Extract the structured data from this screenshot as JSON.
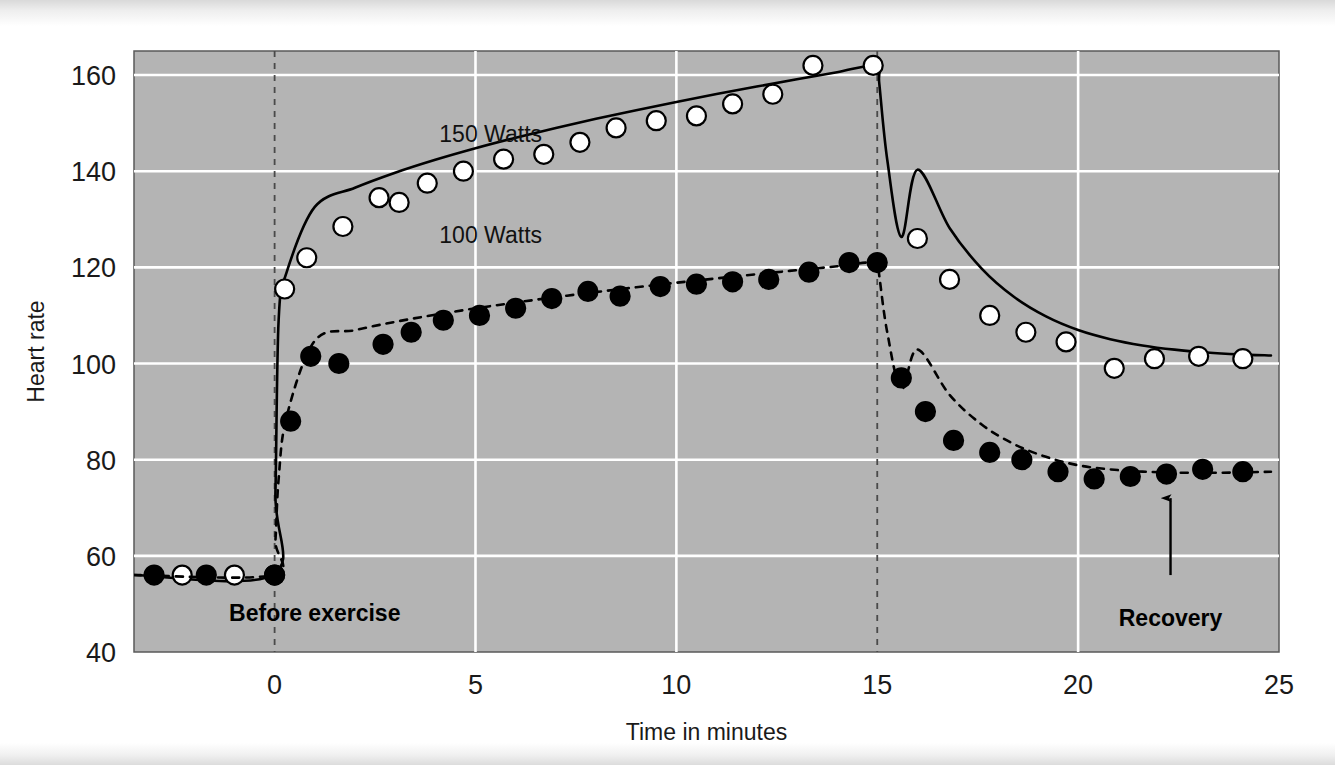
{
  "chart_data": {
    "type": "line",
    "title": "",
    "xlabel": "Time in minutes",
    "ylabel": "Heart rate",
    "xlim": [
      -3.5,
      25
    ],
    "ylim": [
      40,
      165
    ],
    "xticks": [
      0,
      5,
      10,
      15,
      20,
      25
    ],
    "xtick_labels": [
      "0",
      "5",
      "10",
      "15",
      "20",
      "25"
    ],
    "yticks": [
      40,
      60,
      80,
      100,
      120,
      140,
      160
    ],
    "ytick_labels": [
      "40",
      "60",
      "80",
      "100",
      "120",
      "140",
      "160"
    ],
    "grid": "horizontal-white-gridlines-on-gray-panel",
    "legend_position": "inline-labels-on-curves",
    "panel_color": "#b4b4b4",
    "gridline_color": "#ffffff",
    "annotations": [
      {
        "name": "before-exercise",
        "text": "Before exercise",
        "x": 1.0,
        "y": 46.5
      },
      {
        "name": "recovery",
        "text": "Recovery",
        "x": 22.3,
        "y": 45.5
      },
      {
        "name": "exercise-start-marker",
        "text": "",
        "x": 0,
        "y": 0
      },
      {
        "name": "exercise-end-marker",
        "text": "",
        "x": 15,
        "y": 0
      }
    ],
    "vertical_markers": [
      0,
      15
    ],
    "recovery_arrow": {
      "x": 22.3,
      "y_tail": 56,
      "y_head": 72
    },
    "series": [
      {
        "name": "150 Watts",
        "label": "150 Watts",
        "label_x": 4.1,
        "label_y": 146,
        "marker": "open-circle",
        "line_style": "solid",
        "color": "#000000",
        "marker_fill": "#ffffff",
        "x": [
          -2.3,
          -1.0,
          0.0,
          0.25,
          0.8,
          1.7,
          2.6,
          3.1,
          3.8,
          4.7,
          5.7,
          6.7,
          7.6,
          8.5,
          9.5,
          10.5,
          11.4,
          12.4,
          13.4,
          14.9,
          16.0,
          16.8,
          17.8,
          18.7,
          19.7,
          20.9,
          21.9,
          23.0,
          24.1
        ],
        "y": [
          56,
          56,
          56,
          115.5,
          122,
          128.5,
          134.5,
          133.5,
          137.5,
          140,
          142.5,
          143.5,
          146,
          149,
          150.5,
          151.5,
          154,
          156,
          162,
          162,
          126,
          117.5,
          110,
          106.5,
          104.5,
          99,
          101,
          101.5,
          101
        ]
      },
      {
        "name": "100 Watts",
        "label": "100 Watts",
        "label_x": 4.1,
        "label_y": 125,
        "marker": "filled-circle",
        "line_style": "dashed",
        "color": "#000000",
        "marker_fill": "#000000",
        "x": [
          -3.0,
          -1.7,
          0.0,
          0.4,
          0.9,
          1.6,
          2.7,
          3.4,
          4.2,
          5.1,
          6.0,
          6.9,
          7.8,
          8.6,
          9.6,
          10.5,
          11.4,
          12.3,
          13.3,
          14.3,
          15.0,
          15.6,
          16.2,
          16.9,
          17.8,
          18.6,
          19.5,
          20.4,
          21.3,
          22.2,
          23.1,
          24.1
        ],
        "y": [
          56,
          56,
          56,
          88,
          101.5,
          100,
          104,
          106.5,
          109,
          110,
          111.5,
          113.5,
          115,
          114,
          116,
          116.5,
          117,
          117.5,
          119,
          121,
          121,
          97,
          90,
          84,
          81.5,
          80,
          77.5,
          76,
          76.5,
          77,
          78,
          77.5
        ]
      }
    ],
    "baseline_value": 56,
    "baseline_x_range": [
      -3.5,
      0
    ]
  }
}
